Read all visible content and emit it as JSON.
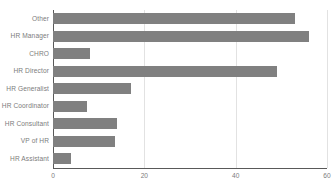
{
  "chart_data": {
    "type": "bar",
    "orientation": "horizontal",
    "title": "",
    "subtitle": "",
    "xlabel": "",
    "ylabel": "",
    "categories": [
      "Other",
      "HR Manager",
      "CHRO",
      "HR Director",
      "HR Generalist",
      "HR Coordinator",
      "HR Consultant",
      "VP of HR",
      "HR Assistant"
    ],
    "values": [
      53,
      56,
      8,
      49,
      17,
      7.5,
      14,
      13.5,
      4
    ],
    "xlim": [
      0,
      60
    ],
    "x_ticks": [
      0,
      20,
      40,
      60
    ],
    "x_tick_labels": [
      "0",
      "20",
      "40",
      "60"
    ],
    "grid": true,
    "grid_axis": "x",
    "legend": false,
    "series": [
      {
        "name": "Respondents",
        "values": [
          53,
          56,
          8,
          49,
          17,
          7.5,
          14,
          13.5,
          4
        ]
      }
    ],
    "colors": {
      "bar": "#808080",
      "gridline": "#e2e2e2",
      "axis": "#595959",
      "tick_text": "#7c7c7c",
      "background": "#ffffff"
    }
  }
}
